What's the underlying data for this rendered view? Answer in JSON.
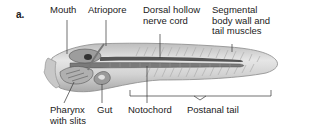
{
  "panel_label": "a.",
  "labels": {
    "mouth": "Mouth",
    "atriopore": "Atriopore",
    "dorsal_nerve_cord": "Dorsal hollow\nnerve cord",
    "segmental_muscles": "Segmental\nbody wall and\ntail muscles",
    "pharynx": "Pharynx\nwith slits",
    "gut": "Gut",
    "notochord": "Notochord",
    "postanal_tail": "Postanal tail"
  },
  "colors": {
    "body_fill": "#d6d6d6",
    "body_dark": "#8a8a8a",
    "leader_line": "#333333"
  }
}
